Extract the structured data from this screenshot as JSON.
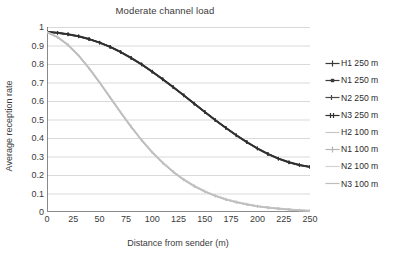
{
  "chart_data": {
    "type": "line",
    "title": "Moderate channel load",
    "xlabel": "Distance from sender (m)",
    "ylabel": "Average reception rate",
    "xlim": [
      0,
      250
    ],
    "ylim": [
      0,
      1
    ],
    "grid": true,
    "legend_position": "right",
    "xticks": [
      "0",
      "25",
      "50",
      "75",
      "100",
      "125",
      "150",
      "175",
      "200",
      "225",
      "250"
    ],
    "yticks": [
      "0",
      "0.1",
      "0.2",
      "0.3",
      "0.4",
      "0.5",
      "0.6",
      "0.7",
      "0.8",
      "0.9",
      "1"
    ],
    "x": [
      0,
      10,
      20,
      30,
      40,
      50,
      60,
      70,
      80,
      90,
      100,
      110,
      120,
      130,
      140,
      150,
      160,
      170,
      180,
      190,
      200,
      210,
      220,
      230,
      240,
      250
    ],
    "series": [
      {
        "name": "H1 250 m",
        "color": "#3a3a3a",
        "marker": "cross",
        "values": [
          0.975,
          0.97,
          0.962,
          0.951,
          0.936,
          0.917,
          0.894,
          0.866,
          0.834,
          0.799,
          0.76,
          0.719,
          0.676,
          0.632,
          0.587,
          0.542,
          0.498,
          0.456,
          0.416,
          0.379,
          0.345,
          0.315,
          0.29,
          0.27,
          0.255,
          0.245
        ]
      },
      {
        "name": "N1 250 m",
        "color": "#3a3a3a",
        "marker": "square",
        "values": [
          0.973,
          0.968,
          0.96,
          0.949,
          0.934,
          0.915,
          0.892,
          0.864,
          0.832,
          0.797,
          0.758,
          0.717,
          0.674,
          0.63,
          0.585,
          0.54,
          0.496,
          0.454,
          0.414,
          0.377,
          0.343,
          0.313,
          0.288,
          0.268,
          0.253,
          0.243
        ]
      },
      {
        "name": "N2 250 m",
        "color": "#4a4a4a",
        "marker": "tick",
        "values": [
          0.972,
          0.967,
          0.959,
          0.948,
          0.933,
          0.914,
          0.891,
          0.863,
          0.831,
          0.796,
          0.757,
          0.716,
          0.673,
          0.629,
          0.584,
          0.539,
          0.495,
          0.453,
          0.413,
          0.376,
          0.342,
          0.312,
          0.287,
          0.267,
          0.252,
          0.242
        ]
      },
      {
        "name": "N3 250 m",
        "color": "#2f2f2f",
        "marker": "double-tick",
        "values": [
          0.974,
          0.969,
          0.961,
          0.95,
          0.935,
          0.916,
          0.893,
          0.865,
          0.833,
          0.798,
          0.759,
          0.718,
          0.675,
          0.631,
          0.586,
          0.541,
          0.497,
          0.455,
          0.415,
          0.378,
          0.344,
          0.314,
          0.289,
          0.269,
          0.254,
          0.244
        ]
      },
      {
        "name": "H2 100 m",
        "color": "#c6c6c6",
        "marker": "line",
        "values": [
          0.973,
          0.947,
          0.905,
          0.848,
          0.779,
          0.702,
          0.621,
          0.54,
          0.462,
          0.39,
          0.325,
          0.268,
          0.219,
          0.177,
          0.142,
          0.113,
          0.089,
          0.07,
          0.055,
          0.043,
          0.033,
          0.026,
          0.02,
          0.015,
          0.011,
          0.008
        ]
      },
      {
        "name": "N1 100 m",
        "color": "#b5b5b5",
        "marker": "cross",
        "values": [
          0.971,
          0.945,
          0.903,
          0.846,
          0.777,
          0.7,
          0.619,
          0.538,
          0.46,
          0.388,
          0.323,
          0.266,
          0.217,
          0.175,
          0.14,
          0.111,
          0.087,
          0.068,
          0.053,
          0.041,
          0.031,
          0.024,
          0.018,
          0.013,
          0.009,
          0.006
        ]
      },
      {
        "name": "N2 100 m",
        "color": "#d2d2d2",
        "marker": "line",
        "values": [
          0.972,
          0.946,
          0.904,
          0.847,
          0.778,
          0.701,
          0.62,
          0.539,
          0.461,
          0.389,
          0.324,
          0.267,
          0.218,
          0.176,
          0.141,
          0.112,
          0.088,
          0.069,
          0.054,
          0.042,
          0.032,
          0.025,
          0.019,
          0.014,
          0.01,
          0.007
        ]
      },
      {
        "name": "N3 100 m",
        "color": "#bdbdbd",
        "marker": "line",
        "values": [
          0.97,
          0.944,
          0.902,
          0.845,
          0.776,
          0.699,
          0.618,
          0.537,
          0.459,
          0.387,
          0.322,
          0.265,
          0.216,
          0.174,
          0.139,
          0.11,
          0.086,
          0.067,
          0.052,
          0.04,
          0.03,
          0.023,
          0.017,
          0.012,
          0.008,
          0.005
        ]
      }
    ]
  }
}
